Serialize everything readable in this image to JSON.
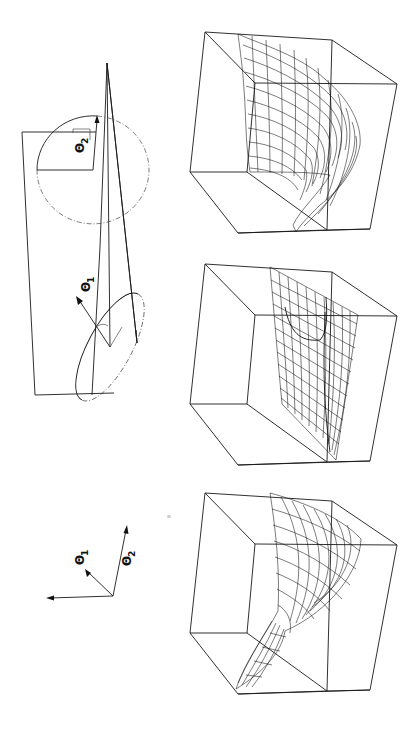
{
  "figure": {
    "orientation": "rotated 90 degrees counter-clockwise",
    "panel_geometry": {
      "description": "Geometric construction of two rotation angles",
      "labels": {
        "theta1": "Θ",
        "theta1_sub": "1",
        "theta2": "Θ",
        "theta2_sub": "2"
      }
    },
    "panel_axes": {
      "description": "Axis orientation glyph",
      "labels": {
        "theta1": "Θ",
        "theta1_sub": "1",
        "theta2": "Θ",
        "theta2_sub": "2"
      }
    },
    "surfaces": [
      {
        "id": "surface-top",
        "description": "Wireframe surface inside bounding cube, bulging saddle shape"
      },
      {
        "id": "surface-middle",
        "description": "Wireframe surface inside bounding cube, nearly planar sheet"
      },
      {
        "id": "surface-bottom",
        "description": "Wireframe surface inside bounding cube, twisted sheet"
      }
    ],
    "colors": {
      "ink": "#1a1a1a",
      "paper": "#ffffff"
    }
  }
}
